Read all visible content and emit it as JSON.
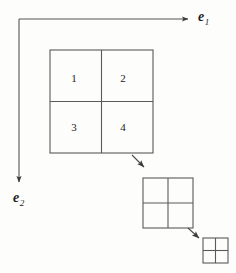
{
  "figure": {
    "background_color": "#fdfdfc",
    "stroke_color": "#4a4a4a",
    "text_color": "#1b1b1b",
    "axes": {
      "origin": {
        "x": 19,
        "y": 19
      },
      "horizontal_axis": {
        "name": "e1-axis",
        "label": "e",
        "subscript": "1",
        "direction": "right",
        "from": {
          "x": 19,
          "y": 19
        },
        "to": {
          "x": 193,
          "y": 19
        }
      },
      "vertical_axis": {
        "name": "e2-axis",
        "label": "e",
        "subscript": "2",
        "direction": "down",
        "from": {
          "x": 19,
          "y": 19
        },
        "to": {
          "x": 19,
          "y": 187
        }
      }
    },
    "grids": [
      {
        "name": "grid-level-0",
        "rows": 2,
        "cols": 2,
        "x": 50,
        "y": 50,
        "size": 103,
        "cells": [
          {
            "label": "1",
            "row": 0,
            "col": 0
          },
          {
            "label": "2",
            "row": 0,
            "col": 1
          },
          {
            "label": "3",
            "row": 1,
            "col": 0
          },
          {
            "label": "4",
            "row": 1,
            "col": 1
          }
        ]
      },
      {
        "name": "grid-level-1",
        "rows": 2,
        "cols": 2,
        "x": 143,
        "y": 178,
        "size": 50,
        "cells": []
      },
      {
        "name": "grid-level-2",
        "rows": 2,
        "cols": 2,
        "x": 203,
        "y": 238,
        "size": 25,
        "cells": []
      }
    ],
    "connector_arrows": [
      {
        "name": "arrow-grid0-to-grid1",
        "from": {
          "x": 132,
          "y": 155
        },
        "to": {
          "x": 146,
          "y": 169
        }
      },
      {
        "name": "arrow-grid1-to-grid2",
        "from": {
          "x": 188,
          "y": 226
        },
        "to": {
          "x": 201,
          "y": 239
        }
      }
    ]
  }
}
